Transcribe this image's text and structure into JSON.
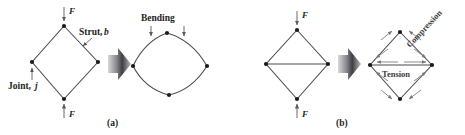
{
  "figure": {
    "background_color": "#ffffff",
    "line_color": "#4b4b50",
    "joint_color": "#1b1b1e",
    "stress_color": "#77777c",
    "transition_arrow_color": "#58585c",
    "panels": [
      {
        "id": "panel-a",
        "caption": "(a)",
        "description": "Pin-jointed diamond frame deforming by bending of struts",
        "left_figure": {
          "name": "undeformed-pin-jointed-diamond",
          "joints": [
            {
              "name": "top",
              "x": 64,
              "y": 26
            },
            {
              "name": "left",
              "x": 32,
              "y": 62
            },
            {
              "name": "right",
              "x": 98,
              "y": 62
            },
            {
              "name": "bottom",
              "x": 64,
              "y": 99
            }
          ],
          "members": [
            {
              "from": "top",
              "to": "right"
            },
            {
              "from": "right",
              "to": "bottom"
            },
            {
              "from": "bottom",
              "to": "left"
            },
            {
              "from": "left",
              "to": "top"
            }
          ],
          "annotations": [
            {
              "name": "strut-label",
              "text": "Strut,",
              "italic_suffix": "b"
            },
            {
              "name": "joint-label",
              "text": "Joint,",
              "italic_suffix": "j"
            }
          ],
          "forces": [
            {
              "name": "force-top",
              "label": "F",
              "direction": "down"
            },
            {
              "name": "force-bottom",
              "label": "F",
              "direction": "up"
            }
          ]
        },
        "right_figure": {
          "name": "deformed-bending-diamond",
          "label": "Bending",
          "joints": [
            {
              "name": "top",
              "x": 167,
              "y": 33
            },
            {
              "name": "left",
              "x": 133,
              "y": 66
            },
            {
              "name": "right",
              "x": 207,
              "y": 66
            },
            {
              "name": "bottom",
              "x": 169,
              "y": 95
            }
          ],
          "bending_arrows": 2
        }
      },
      {
        "id": "panel-b",
        "caption": "(b)",
        "description": "Braced diamond frame carrying load in tension and compression",
        "left_figure": {
          "name": "braced-diamond",
          "joints": [
            {
              "name": "top",
              "x": 297,
              "y": 30
            },
            {
              "name": "left",
              "x": 266,
              "y": 64
            },
            {
              "name": "right",
              "x": 328,
              "y": 64
            },
            {
              "name": "bottom",
              "x": 297,
              "y": 99
            }
          ],
          "members": [
            {
              "from": "top",
              "to": "right"
            },
            {
              "from": "right",
              "to": "bottom"
            },
            {
              "from": "bottom",
              "to": "left"
            },
            {
              "from": "left",
              "to": "top"
            },
            {
              "from": "left",
              "to": "right",
              "type": "brace"
            }
          ],
          "forces": [
            {
              "name": "force-top",
              "label": "F",
              "direction": "down"
            },
            {
              "name": "force-bottom",
              "label": "F",
              "direction": "up"
            }
          ]
        },
        "right_figure": {
          "name": "stressed-braced-diamond",
          "joints": [
            {
              "name": "top",
              "x": 400,
              "y": 32
            },
            {
              "name": "left",
              "x": 370,
              "y": 65
            },
            {
              "name": "right",
              "x": 432,
              "y": 65
            },
            {
              "name": "bottom",
              "x": 400,
              "y": 99
            }
          ],
          "stress_labels": [
            {
              "name": "compression-label",
              "text": "Compression",
              "orientation": "rotated-45",
              "member": "top-right-edge"
            },
            {
              "name": "tension-label",
              "text": "Tension",
              "orientation": "horizontal",
              "member": "horizontal-brace"
            }
          ]
        }
      }
    ],
    "transition_arrows": [
      {
        "name": "transition-arrow-a",
        "x": 118,
        "y": 64
      },
      {
        "name": "transition-arrow-b",
        "x": 348,
        "y": 64
      }
    ]
  }
}
